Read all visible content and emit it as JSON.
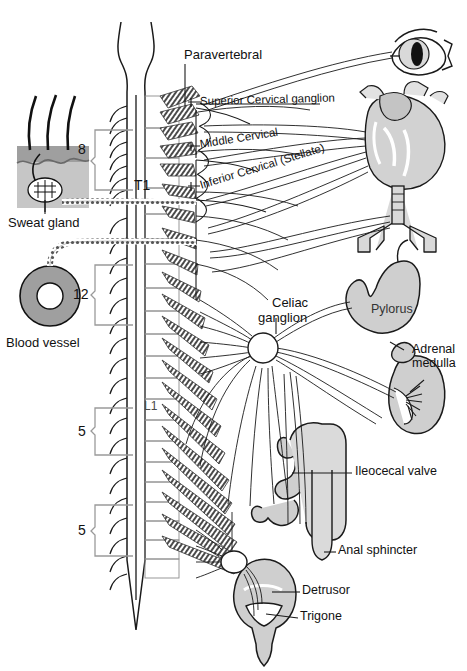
{
  "figure": {
    "colors": {
      "stroke": "#1a1a1a",
      "organ_fill": "#c9c9c9",
      "organ_fill_light": "#dcdcdc",
      "skin_fill": "#b3b3b3",
      "skin_band": "#9a9a9a",
      "ganglion_fill": "#ffffff",
      "bracket": "#9a9a9a",
      "text": "#111111"
    }
  },
  "labels": {
    "paravertebral": "Paravertebral",
    "superior_cervical": "Superior Cervical ganglion",
    "middle_cervical": "Middle Cervical",
    "inferior_cervical": "Inferior Cervical (Stellate)",
    "celiac_line1": "Celiac",
    "celiac_line2": "ganglion",
    "pylorus": "Pylorus",
    "adrenal_line1": "Adrenal",
    "adrenal_line2": "medulla",
    "ileocecal": "Ileocecal valve",
    "anal_sphincter": "Anal sphincter",
    "detrusor": "Detrusor",
    "trigone": "Trigone",
    "sweat_gland": "Sweat gland",
    "blood_vessel": "Blood vessel"
  },
  "spinal_segments": {
    "cervical_count": "8",
    "t1_marker": "T1",
    "thoracic_count": "12",
    "l1_marker": "L1",
    "lumbar_count": "5",
    "sacral_count": "5"
  },
  "organs": [
    {
      "name": "eye",
      "label": ""
    },
    {
      "name": "heart",
      "label": ""
    },
    {
      "name": "bronchi",
      "label": ""
    },
    {
      "name": "stomach",
      "label": "Pylorus"
    },
    {
      "name": "kidney",
      "label": "Adrenal medulla"
    },
    {
      "name": "intestine",
      "label": "Ileocecal valve"
    },
    {
      "name": "rectum",
      "label": "Anal sphincter"
    },
    {
      "name": "bladder",
      "label": "Detrusor"
    },
    {
      "name": "sweat-gland",
      "label": "Sweat gland"
    },
    {
      "name": "blood-vessel",
      "label": "Blood vessel"
    }
  ]
}
